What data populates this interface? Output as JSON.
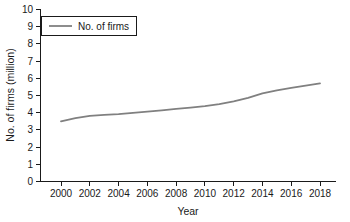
{
  "chart_data": {
    "type": "line",
    "title": "",
    "xlabel": "Year",
    "ylabel": "No. of firms (million)",
    "xlim": [
      1999,
      2018.6
    ],
    "ylim": [
      0,
      10
    ],
    "grid": false,
    "legend_position": "top-left",
    "legend_entries": [
      "No. of firms"
    ],
    "xticks": [
      "2000",
      "2002",
      "2004",
      "2006",
      "2008",
      "2010",
      "2012",
      "2014",
      "2016",
      "2018"
    ],
    "yticks": [
      "0",
      "1",
      "2",
      "3",
      "4",
      "5",
      "6",
      "7",
      "8",
      "9",
      "10"
    ],
    "series": [
      {
        "name": "No. of firms",
        "color": "#808080",
        "x": [
          2000,
          2001,
          2002,
          2003,
          2004,
          2005,
          2006,
          2007,
          2008,
          2009,
          2010,
          2011,
          2012,
          2013,
          2014,
          2015,
          2016,
          2017,
          2018
        ],
        "values": [
          3.5,
          3.68,
          3.82,
          3.87,
          3.92,
          3.99,
          4.06,
          4.14,
          4.22,
          4.3,
          4.38,
          4.5,
          4.66,
          4.86,
          5.12,
          5.3,
          5.44,
          5.58,
          5.7
        ]
      }
    ]
  },
  "legend": {
    "label": "No. of firms"
  },
  "axes": {
    "x_title": "Year",
    "y_title": "No. of firms (million)"
  }
}
